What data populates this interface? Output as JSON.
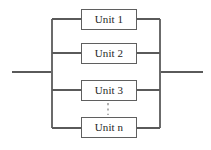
{
  "diagram": {
    "type": "reliability-block-diagram",
    "topology": "parallel",
    "canvas": {
      "width": 211,
      "height": 150,
      "background": "#ffffff"
    },
    "colors": {
      "line": "#5a5a5a",
      "bus": "#6b6b6b",
      "box_border": "#5f5f5f",
      "box_fill": "#ffffff",
      "text": "#1d1d1d",
      "ellipsis": "#6e6e6e"
    },
    "units": [
      {
        "label": "Unit 1",
        "x": 81,
        "y": 9,
        "width": 56,
        "height": 21
      },
      {
        "label": "Unit 2",
        "x": 81,
        "y": 43,
        "width": 56,
        "height": 21
      },
      {
        "label": "Unit 3",
        "x": 81,
        "y": 80,
        "width": 56,
        "height": 21
      },
      {
        "label": "Unit n",
        "x": 81,
        "y": 117,
        "width": 56,
        "height": 21
      }
    ],
    "ellipsis": {
      "x": 108,
      "y1": 103,
      "y2": 115,
      "style": "dashed-vertical"
    },
    "buses": {
      "left": {
        "x": 52,
        "y1": 19,
        "y2": 128
      },
      "right": {
        "x": 160,
        "y1": 19,
        "y2": 128
      }
    },
    "leads": {
      "input": {
        "x1": 12,
        "x2": 52,
        "y": 72
      },
      "output": {
        "x1": 160,
        "x2": 203,
        "y": 72
      }
    },
    "stubs": [
      {
        "side": "left",
        "x1": 52,
        "x2": 81,
        "y": 19
      },
      {
        "side": "right",
        "x1": 137,
        "x2": 160,
        "y": 19
      },
      {
        "side": "left",
        "x1": 52,
        "x2": 81,
        "y": 53
      },
      {
        "side": "right",
        "x1": 137,
        "x2": 160,
        "y": 53
      },
      {
        "side": "left",
        "x1": 52,
        "x2": 81,
        "y": 90
      },
      {
        "side": "right",
        "x1": 137,
        "x2": 160,
        "y": 90
      },
      {
        "side": "left",
        "x1": 52,
        "x2": 81,
        "y": 128
      },
      {
        "side": "right",
        "x1": 137,
        "x2": 160,
        "y": 128
      }
    ]
  }
}
